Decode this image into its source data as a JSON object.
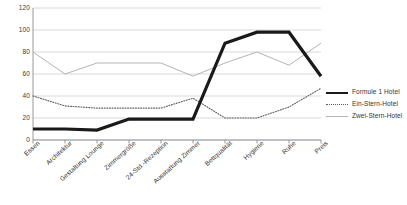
{
  "chart_data": {
    "type": "line",
    "title": "",
    "xlabel": "",
    "ylabel": "",
    "ylim": [
      0,
      120
    ],
    "yticks": [
      0,
      20,
      40,
      60,
      80,
      100,
      120
    ],
    "grid": true,
    "legend_position": "right",
    "categories": [
      "Essen",
      "Architektur",
      "Gestaltung Lounge",
      "Zimmergröße",
      "24-Std.-Rezeption",
      "Ausstattung Zimmer",
      "Bettqualität",
      "Hygiene",
      "Ruhe",
      "Preis"
    ],
    "series": [
      {
        "name": "Formule 1 Hotel",
        "color": "#1a1a1a",
        "style": "solid",
        "width": 3.2,
        "values": [
          10,
          10,
          9,
          19,
          19,
          19,
          88,
          98,
          98,
          58
        ]
      },
      {
        "name": "Ein-Stern-Hotel",
        "color": "#5e5e5e",
        "style": "dotted",
        "width": 1.1,
        "values": [
          40,
          31,
          29,
          29,
          29,
          38,
          20,
          20,
          30,
          47
        ]
      },
      {
        "name": "Zwei-Stern-Hotel",
        "color": "#b4b4b4",
        "style": "solid",
        "width": 1,
        "values": [
          80,
          60,
          70,
          70,
          70,
          58,
          70,
          80,
          68,
          88
        ]
      }
    ]
  },
  "axes": {
    "y_tick_labels": [
      "120",
      "100",
      "80",
      "60",
      "40",
      "20",
      "0"
    ],
    "x_tick_labels": [
      "Essen",
      "Architektur",
      "Gestaltung Lounge",
      "Zimmergröße",
      "24-Std.-Rezeption",
      "Ausstattung Zimmer",
      "Bettqualität",
      "Hygiene",
      "Ruhe",
      "Preis"
    ]
  },
  "legend": {
    "items": [
      {
        "label": "Formule 1 Hotel",
        "style": "solid"
      },
      {
        "label": "Ein-Stern-Hotel",
        "style": "dotted"
      },
      {
        "label": "Zwei-Stern-Hotel",
        "style": "thin"
      }
    ]
  },
  "colors": {
    "axis": "#808080",
    "grid": "#c8c8c8",
    "series_1": "#1a1a1a",
    "series_2": "#5e5e5e",
    "series_3": "#b4b4b4",
    "text": "#333333",
    "background": "#ffffff"
  }
}
